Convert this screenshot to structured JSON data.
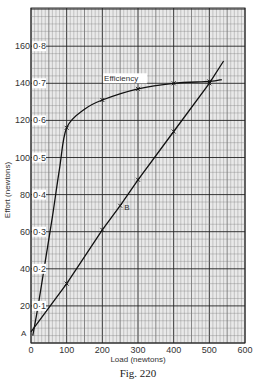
{
  "figure": {
    "caption": "Fig. 220"
  },
  "chart_data": {
    "type": "line",
    "title": "",
    "caption": "Fig. 220",
    "xlabel": "Load (newtons)",
    "ylabel": "Effort (newtons)",
    "xlim": [
      0,
      600
    ],
    "ylim": [
      0,
      180
    ],
    "x_ticks": [
      0,
      100,
      200,
      300,
      400,
      500,
      600
    ],
    "y_ticks": [
      20,
      40,
      60,
      80,
      100,
      120,
      140,
      160
    ],
    "y2_ticks": [
      "0·1",
      "0·2",
      "0·3",
      "0·4",
      "0·5",
      "0·6",
      "0·7",
      "0·8"
    ],
    "y2_label": "Efficiency (0–0.9 scale, 0.1 per 20 newtons)",
    "grid": true,
    "legend": null,
    "series": [
      {
        "name": "Effort",
        "axis": "left",
        "x": [
          0,
          100,
          200,
          250,
          300,
          400,
          500,
          540
        ],
        "values": [
          6,
          32,
          61,
          74,
          88,
          114,
          140,
          152
        ],
        "markers_at": [
          100,
          200,
          250,
          300,
          400,
          500
        ]
      },
      {
        "name": "Efficiency",
        "axis": "right",
        "x": [
          5,
          20,
          40,
          60,
          80,
          100,
          150,
          200,
          300,
          400,
          500,
          535
        ],
        "values": [
          0.02,
          0.1,
          0.22,
          0.34,
          0.47,
          0.58,
          0.63,
          0.655,
          0.685,
          0.7,
          0.705,
          0.71
        ],
        "markers_at": [
          100,
          200,
          300,
          400,
          500
        ]
      }
    ],
    "annotations": [
      {
        "text": "A",
        "x": 0,
        "y": 6,
        "note": "effort-axis intercept"
      },
      {
        "text": "B",
        "x": 250,
        "y": 74,
        "note": "point on effort line"
      },
      {
        "text": "Efficiency",
        "x": 250,
        "y": 138,
        "note": "label on efficiency curve"
      }
    ]
  }
}
